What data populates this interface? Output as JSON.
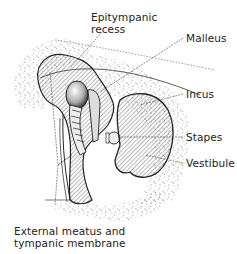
{
  "diagram": {
    "labels": {
      "epitympanic_line1": "Epitympanic",
      "epitympanic_line2": "recess",
      "malleus": "Malleus",
      "incus": "Incus",
      "stapes": "Stapes",
      "vestibule": "Vestibule",
      "meatus_line1": "External meatus and",
      "meatus_line2": "tympanic membrane"
    },
    "colors": {
      "ink": "#222222",
      "background": "#ffffff",
      "stipple": "#555555"
    }
  }
}
